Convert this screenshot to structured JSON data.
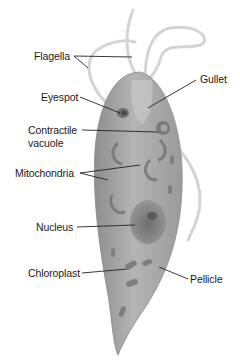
{
  "diagram": {
    "labels": {
      "flagella": "Flagella",
      "gullet": "Gullet",
      "eyespot": "Eyespot",
      "contractile_vacuole_line1": "Contractile",
      "contractile_vacuole_line2": "vacuole",
      "mitochondria": "Mitochondria",
      "nucleus": "Nucleus",
      "chloroplast": "Chloroplast",
      "pellicle": "Pellicle"
    },
    "colors": {
      "background": "#ffffff",
      "body": "#a9a9a9",
      "body_dark": "#7d7d7d",
      "flagellum": "#d9d9d9",
      "leader_line": "#222222",
      "text": "#1a1a1a"
    }
  }
}
